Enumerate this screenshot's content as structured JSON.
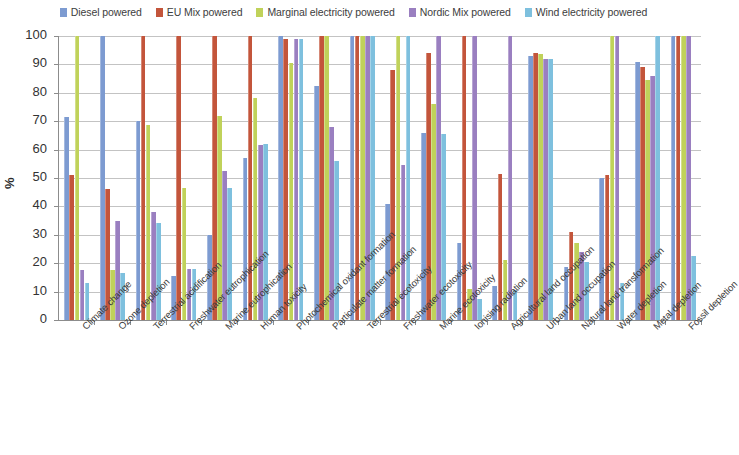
{
  "chart_data": {
    "type": "bar",
    "title": "",
    "subtitle": "",
    "xlabel": "",
    "ylabel": "%",
    "ylim": [
      0,
      100
    ],
    "yticks": [
      0,
      10,
      20,
      30,
      40,
      50,
      60,
      70,
      80,
      90,
      100
    ],
    "grid": true,
    "legend_position": "top",
    "orientation": "vertical",
    "grouping": "clustered",
    "categories": [
      "Climate change",
      "Ozone depletion",
      "Terrestrial acidification",
      "Freshwater eutrophication",
      "Marine eutrophication",
      "Human toxicity",
      "Photochemical oxidant formation",
      "Particulate matter formation",
      "Terrestrial ecotoxicity",
      "Freshwater ecotoxicity",
      "Marine ecotoxicity",
      "Ionising radiation",
      "Agricultural land occupation",
      "Urban land occupation",
      "Natural land transformation",
      "Water depletion",
      "Metal depletion",
      "Fossil depletion"
    ],
    "series": [
      {
        "name": "Diesel powered",
        "color": "#7D9BD1",
        "values": [
          71.5,
          100,
          70,
          15.5,
          30,
          57,
          100,
          82.5,
          100,
          41,
          66,
          27,
          12,
          93,
          18.5,
          50,
          91,
          100
        ]
      },
      {
        "name": "EU Mix powered",
        "color": "#C3553B",
        "values": [
          51,
          46,
          100,
          100,
          100,
          100,
          99,
          100,
          100,
          88,
          94,
          100,
          51.5,
          94,
          31,
          51,
          89,
          100
        ]
      },
      {
        "name": "Marginal electricity powered",
        "color": "#C0D25A",
        "values": [
          100,
          17.5,
          68.5,
          46.5,
          72,
          78,
          90.5,
          100,
          100,
          100,
          76,
          11,
          21,
          93.5,
          27,
          100,
          84.5,
          100
        ]
      },
      {
        "name": "Nordic Mix powered",
        "color": "#9A7FC0",
        "values": [
          17.5,
          35,
          38,
          18,
          52.5,
          61.5,
          99,
          68,
          100,
          54.5,
          100,
          100,
          100,
          92,
          24,
          100,
          86,
          100
        ]
      },
      {
        "name": "Wind electricity powered",
        "color": "#7EC0DE",
        "values": [
          13,
          16.5,
          34,
          18,
          46.5,
          62,
          99,
          56,
          100,
          100,
          65.5,
          7.5,
          10.5,
          92,
          20.5,
          13,
          100,
          22.5
        ]
      }
    ]
  },
  "legend": {
    "items": [
      {
        "label": "Diesel powered",
        "color": "#7D9BD1"
      },
      {
        "label": "EU Mix powered",
        "color": "#C3553B"
      },
      {
        "label": "Marginal electricity powered",
        "color": "#C0D25A"
      },
      {
        "label": "Nordic Mix powered",
        "color": "#9A7FC0"
      },
      {
        "label": "Wind electricity powered",
        "color": "#7EC0DE"
      }
    ]
  },
  "axes": {
    "y_title": "%"
  }
}
